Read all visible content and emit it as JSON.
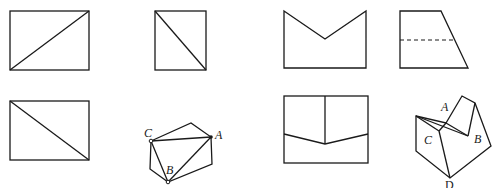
{
  "figures": [
    {
      "id": "fig-1",
      "desc": "rectangle with diagonal from bottom-left to top-right"
    },
    {
      "id": "fig-2",
      "desc": "rectangle with diagonal from top-left to bottom-right"
    },
    {
      "id": "fig-3",
      "desc": "rectangle with V-notch cut at top"
    },
    {
      "id": "fig-4",
      "desc": "right trapezoid with dashed horizontal line"
    },
    {
      "id": "fig-5",
      "desc": "rectangle with diagonal from top-left to bottom-right"
    },
    {
      "id": "fig-6",
      "desc": "folded polygon with points C, A, B",
      "labels": {
        "C": "C",
        "A": "A",
        "B": "B"
      }
    },
    {
      "id": "fig-7",
      "desc": "rectangle with vertical center line and V line"
    },
    {
      "id": "fig-8",
      "desc": "folded 3D shape with points A, B, C, D",
      "labels": {
        "A": "A",
        "B": "B",
        "C": "C",
        "D": "D"
      }
    }
  ],
  "colors": {
    "stroke": "#1a1a1a",
    "background": "#ffffff"
  }
}
